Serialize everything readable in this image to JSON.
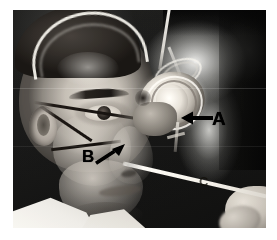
{
  "figure": {
    "media_type": "photograph",
    "tone": "black-and-white halftone",
    "border_color": "#ffffff",
    "plate_color": "#1d1d1d"
  },
  "annotations": {
    "items": [
      {
        "id": "a",
        "label": "A",
        "points_to": "cylindrical lens housing of the apparatus",
        "arrow_direction": "left",
        "color": "#000000"
      },
      {
        "id": "b",
        "label": "B",
        "points_to": "mask strap and nosepiece on the cheek",
        "arrow_direction": "up-right",
        "color": "#000000"
      },
      {
        "id": "c",
        "label": "C",
        "points_to": "background marker at lower right",
        "arrow_direction": "none",
        "color": "#17150f"
      }
    ]
  },
  "subject": {
    "pose": "left profile",
    "wearing": [
      "white head strap",
      "dark face mask strap",
      "white coat"
    ]
  },
  "apparatus": {
    "name": "cylindrical lens housing",
    "parts": [
      "barrel",
      "mounting block",
      "feed tube",
      "probe rod"
    ]
  },
  "examiner": {
    "visible": "hand holding probe rod at lower right"
  }
}
